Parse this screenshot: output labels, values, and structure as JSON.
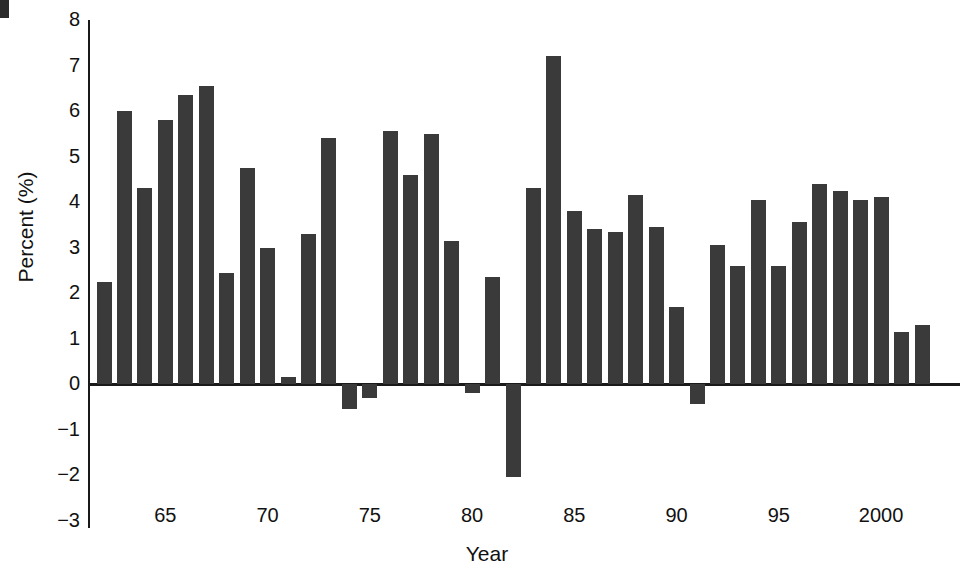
{
  "chart_data": {
    "type": "bar",
    "title": "",
    "subtitle": "",
    "xlabel": "Year",
    "ylabel": "Percent (%)",
    "ylim": [
      -3,
      8
    ],
    "yticks": [
      8,
      7,
      6,
      5,
      4,
      3,
      2,
      1,
      0,
      -1,
      -2,
      -3
    ],
    "ytick_labels": [
      "8",
      "7",
      "6",
      "5",
      "4",
      "3",
      "2",
      "1",
      "0",
      "−1",
      "−2",
      "−3"
    ],
    "xtick_years": [
      65,
      70,
      75,
      80,
      85,
      90,
      95,
      2000
    ],
    "xtick_labels": [
      "65",
      "70",
      "75",
      "80",
      "85",
      "90",
      "95",
      "2000"
    ],
    "xlim": [
      1961.5,
      2002.5
    ],
    "grid": false,
    "legend": null,
    "bar_color": "#3a3a3a",
    "axis_color": "#1a1a1a",
    "background": "#ffffff",
    "categories": [
      1962,
      1963,
      1964,
      1965,
      1966,
      1967,
      1968,
      1969,
      1970,
      1971,
      1972,
      1973,
      1974,
      1975,
      1976,
      1977,
      1978,
      1979,
      1980,
      1981,
      1982,
      1983,
      1984,
      1985,
      1986,
      1987,
      1988,
      1989,
      1990,
      1991,
      1992,
      1993,
      1994,
      1995,
      1996,
      1997,
      1998,
      1999,
      2000,
      2001,
      2002
    ],
    "values": [
      2.25,
      6.0,
      4.3,
      5.8,
      6.35,
      6.55,
      2.45,
      4.75,
      3.0,
      0.15,
      3.3,
      5.4,
      -0.55,
      -0.3,
      5.55,
      4.6,
      5.5,
      3.15,
      -0.2,
      2.35,
      -2.05,
      4.3,
      7.2,
      3.8,
      3.4,
      3.35,
      4.15,
      3.45,
      1.7,
      -0.45,
      3.05,
      2.6,
      4.05,
      2.6,
      3.55,
      4.4,
      4.25,
      4.05,
      4.1,
      1.15,
      1.3
    ]
  },
  "figure": {
    "axis_title_y": "Percent (%)",
    "axis_title_x": "Year"
  }
}
